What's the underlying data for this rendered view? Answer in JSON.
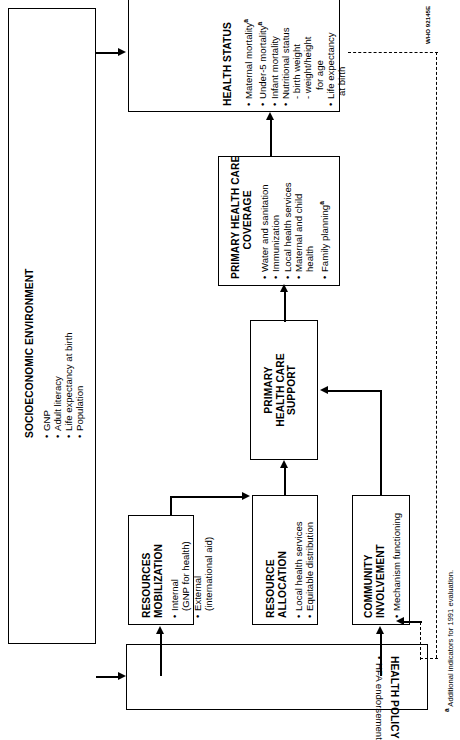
{
  "diagram": {
    "outer": {
      "title": "SOCIOECONOMIC ENVIRONMENT",
      "bullets": [
        "GNP",
        "Adult literacy",
        "Life expectancy at birth",
        "Population"
      ]
    },
    "boxes": {
      "health_policy": {
        "title": "HEALTH POLICY",
        "bullets": [
          "HFA endorsement"
        ]
      },
      "resources_mobilization": {
        "title_line1": "RESOURCES",
        "title_line2": "MOBILIZATION",
        "bullets": [
          "Internal",
          "External"
        ],
        "sub": [
          "(GNP for health)",
          "(international aid)"
        ],
        "items": [
          {
            "bullet": "Internal",
            "sub": "(GNP for health)"
          },
          {
            "bullet": "External",
            "sub": "(international aid)"
          }
        ]
      },
      "resource_allocation": {
        "title_line1": "RESOURCE",
        "title_line2": "ALLOCATION",
        "bullets": [
          "Local health services",
          "Equitable distribution"
        ]
      },
      "community_involvement": {
        "title_line1": "COMMUNITY",
        "title_line2": "INVOLVEMENT",
        "bullets": [
          "Mechanism functioning"
        ]
      },
      "phc_support": {
        "title_line1": "PRIMARY",
        "title_line2": "HEALTH CARE",
        "title_line3": "SUPPORT"
      },
      "phc_coverage": {
        "title_line1": "PRIMARY HEALTH CARE",
        "title_line2": "COVERAGE",
        "items": [
          {
            "label": "Water and sanitation",
            "marker": ""
          },
          {
            "label": "Immunization",
            "marker": ""
          },
          {
            "label": "Local health services",
            "marker": ""
          },
          {
            "label": "Maternal and child",
            "marker": ""
          },
          {
            "label": "health",
            "marker": "",
            "cont": true
          },
          {
            "label": "Family planning",
            "marker": "a"
          }
        ]
      },
      "health_status": {
        "title": "HEALTH STATUS",
        "items": [
          {
            "label": "Maternal mortality",
            "marker": "a",
            "bullet": true
          },
          {
            "label": "Under-5 mortality",
            "marker": "a",
            "bullet": true
          },
          {
            "label": "Infant mortality",
            "marker": "",
            "bullet": true
          },
          {
            "label": "Nutritional status",
            "marker": "",
            "bullet": true
          },
          {
            "label": "- birth weight",
            "marker": "",
            "bullet": false
          },
          {
            "label": "- weight/height",
            "marker": "",
            "bullet": false
          },
          {
            "label": "for age",
            "marker": "",
            "bullet": false
          },
          {
            "label": "Life expectancy",
            "marker": "",
            "bullet": true
          },
          {
            "label": "at birth",
            "marker": "",
            "bullet": false
          }
        ]
      }
    },
    "footnote": "ᵃ Additional indicators for 1991 evaluation.",
    "footnote_text": "Additional indicators for 1991 evaluation.",
    "footnote_marker": "a",
    "source_code": "WHO 92145E",
    "colors": {
      "line": "#000000",
      "background": "#ffffff",
      "text": "#000000"
    }
  }
}
